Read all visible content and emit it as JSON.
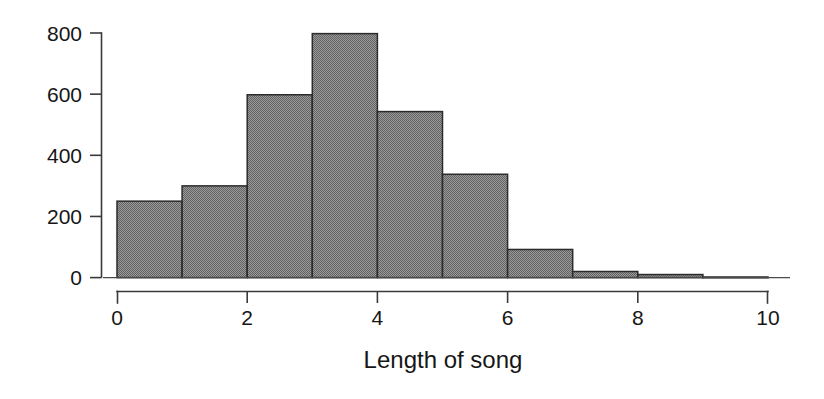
{
  "figure": {
    "background_color": "#ffffff",
    "ink_color": "#1a1a1a"
  },
  "chart_data": {
    "type": "bar",
    "chart_subtype": "histogram",
    "title": "",
    "xlabel": "Length of song",
    "ylabel": "",
    "bin_width": 1,
    "bin_edges": [
      0,
      1,
      2,
      3,
      4,
      5,
      6,
      7,
      8,
      9,
      10
    ],
    "categories": [
      "0-1",
      "1-2",
      "2-3",
      "3-4",
      "4-5",
      "5-6",
      "6-7",
      "7-8",
      "8-9",
      "9-10"
    ],
    "values": [
      250,
      300,
      598,
      798,
      543,
      338,
      92,
      20,
      10,
      2
    ],
    "xlim": [
      0,
      10
    ],
    "ylim": [
      0,
      800
    ],
    "xticks": [
      0,
      2,
      4,
      6,
      8,
      10
    ],
    "xtick_labels": [
      "0",
      "2",
      "4",
      "6",
      "8",
      "10"
    ],
    "yticks": [
      0,
      200,
      400,
      600,
      800
    ],
    "ytick_labels": [
      "0",
      "200",
      "400",
      "600",
      "800"
    ],
    "grid": false,
    "legend": false,
    "legend_position": "none",
    "bar_fill_color": "#808080",
    "bar_fill_pattern": "dither-50",
    "bar_edge_color": "#2b2b2b",
    "annotations": []
  },
  "axes": {
    "x_axis_title": "Length of song",
    "y_tick_labels": [
      "800",
      "600",
      "400",
      "200",
      "0"
    ],
    "x_tick_labels": [
      "0",
      "2",
      "4",
      "6",
      "8",
      "10"
    ]
  }
}
